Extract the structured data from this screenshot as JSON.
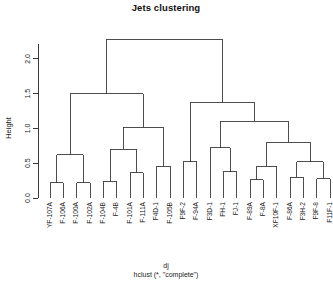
{
  "chart_data": {
    "type": "dendrogram",
    "title": "Jets clustering",
    "xlabel": "dj",
    "subtitle": "hclust (*, \"complete\")",
    "ylabel": "Height",
    "ylim": [
      0.0,
      2.3
    ],
    "yticks": [
      0.0,
      0.5,
      1.0,
      1.5,
      2.0
    ],
    "ytick_labels": [
      "0.0",
      "0.5",
      "1.0",
      "1.5",
      "2.0"
    ],
    "method": "complete",
    "grid": false,
    "legend": "none",
    "n_leaves": 22,
    "leaves": [
      "YF-107A",
      "F-106A",
      "F-100A",
      "F-102A",
      "F-104B",
      "F-4B",
      "F-101A",
      "F-111A",
      "F4D-1",
      "F-105B",
      "F9F-2",
      "F-94A",
      "F3D-1",
      "FH-1",
      "FJ-1",
      "F-89A",
      "F-8A",
      "XF10F-1",
      "F-86A",
      "F3H-2",
      "F9F-8",
      "F11F-1"
    ],
    "merges": [
      {
        "id": "m1",
        "left": "YF-107A",
        "right": "F-106A",
        "height": 0.22
      },
      {
        "id": "m2",
        "left": "F-100A",
        "right": "F-102A",
        "height": 0.22
      },
      {
        "id": "m3",
        "left": "m1",
        "right": "m2",
        "height": 0.62
      },
      {
        "id": "m4",
        "left": "F-104B",
        "right": "F-4B",
        "height": 0.24
      },
      {
        "id": "m5",
        "left": "F-101A",
        "right": "F-111A",
        "height": 0.36
      },
      {
        "id": "m6",
        "left": "m4",
        "right": "m5",
        "height": 0.7
      },
      {
        "id": "m7",
        "left": "F4D-1",
        "right": "F-105B",
        "height": 0.46
      },
      {
        "id": "m8",
        "left": "m6",
        "right": "m7",
        "height": 1.02
      },
      {
        "id": "m9",
        "left": "m3",
        "right": "m8",
        "height": 1.5
      },
      {
        "id": "m10",
        "left": "F9F-2",
        "right": "F-94A",
        "height": 0.52
      },
      {
        "id": "m11",
        "left": "FH-1",
        "right": "FJ-1",
        "height": 0.38
      },
      {
        "id": "m12",
        "left": "F3D-1",
        "right": "m11",
        "height": 0.72
      },
      {
        "id": "m13",
        "left": "F-89A",
        "right": "F-8A",
        "height": 0.26
      },
      {
        "id": "m14",
        "left": "m13",
        "right": "XF10F-1",
        "height": 0.46
      },
      {
        "id": "m15",
        "left": "F-86A",
        "right": "F3H-2",
        "height": 0.3
      },
      {
        "id": "m16",
        "left": "F9F-8",
        "right": "F11F-1",
        "height": 0.28
      },
      {
        "id": "m17",
        "left": "m15",
        "right": "m16",
        "height": 0.52
      },
      {
        "id": "m18",
        "left": "m14",
        "right": "m17",
        "height": 0.8
      },
      {
        "id": "m19",
        "left": "m12",
        "right": "m18",
        "height": 1.1
      },
      {
        "id": "m20",
        "left": "m10",
        "right": "m19",
        "height": 1.38
      },
      {
        "id": "m21",
        "left": "m9",
        "right": "m20",
        "height": 2.28
      }
    ],
    "colors": {
      "line": "#3a3a3a",
      "axis": "#3a3a3a",
      "text": "#1a1a1a",
      "background": "#ffffff"
    }
  }
}
